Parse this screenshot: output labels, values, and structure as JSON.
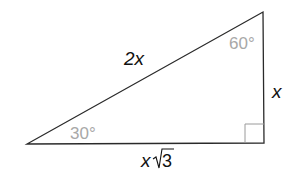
{
  "diagram": {
    "type": "30-60-90 right triangle",
    "vertices": {
      "top_right": [
        263,
        12
      ],
      "bottom_right": [
        264,
        143
      ],
      "bottom_left": [
        27,
        144
      ]
    },
    "sides": {
      "hypotenuse": "2x",
      "short_leg": "x",
      "long_leg_var": "x",
      "long_leg_radical": "3"
    },
    "angles": {
      "top": "60°",
      "left": "30°"
    },
    "colors": {
      "line": "#2a2a2a",
      "angle_label": "#a8a8a8",
      "side_label": "#111111",
      "right_angle_mark": "#9a9a9a"
    }
  }
}
